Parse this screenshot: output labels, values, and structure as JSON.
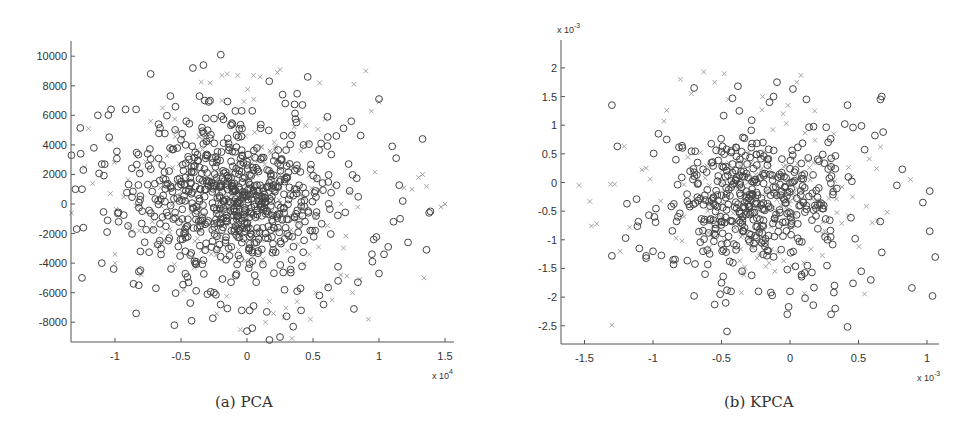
{
  "figure": {
    "captions": {
      "a": "(a) PCA",
      "b": "(b) KPCA"
    }
  },
  "colors": {
    "axis": "#555555",
    "circle": "#454545",
    "cross": "#9a9a9a",
    "text": "#333333"
  },
  "chart_data": [
    {
      "id": "pca",
      "type": "scatter",
      "title": "(a) PCA",
      "xlabel": "",
      "ylabel": "",
      "x_multiplier": "x 10^4",
      "x_multiplier_base": "x 10",
      "x_multiplier_exp": "4",
      "y_multiplier": "",
      "xlim": [
        -1.3,
        1.55
      ],
      "ylim": [
        -9400,
        11000
      ],
      "xticks": [
        -1,
        -0.5,
        0,
        0.5,
        1,
        1.5
      ],
      "xtick_labels": [
        "-1",
        "-0.5",
        "0",
        "0.5",
        "1",
        "1.5"
      ],
      "yticks": [
        -8000,
        -6000,
        -4000,
        -2000,
        0,
        2000,
        4000,
        6000,
        8000,
        10000
      ],
      "ytick_labels": [
        "-8000",
        "-6000",
        "-4000",
        "-2000",
        "0",
        "2000",
        "4000",
        "6000",
        "8000",
        "10000"
      ],
      "grid": false,
      "box": "left-bottom only",
      "legend": null,
      "pixel_frame": {
        "x0": 71,
        "y_top": 41,
        "y_axis": 342,
        "x_end": 454,
        "x_zero": 247,
        "px_per_x": 132,
        "y_zero": 204,
        "px_per_y": 0.01478
      },
      "cloud": {
        "center": [
          -0.1,
          500
        ],
        "spread": [
          0.38,
          2600
        ],
        "n_circle": 700,
        "n_cross": 230,
        "seed": 17
      },
      "series": [
        {
          "name": "class-circle",
          "marker": "o",
          "points": [
            [
              -0.41,
              9200
            ],
            [
              -0.33,
              9400
            ],
            [
              -0.73,
              8800
            ],
            [
              0.46,
              8600
            ],
            [
              -0.58,
              7300
            ],
            [
              -0.36,
              7300
            ],
            [
              1.0,
              7100
            ],
            [
              -0.28,
              7000
            ],
            [
              -0.32,
              7000
            ],
            [
              0.27,
              7400
            ],
            [
              0.29,
              6800
            ],
            [
              0.42,
              6700
            ],
            [
              -1.03,
              6400
            ],
            [
              -0.92,
              6400
            ],
            [
              -0.84,
              6400
            ],
            [
              -1.13,
              6000
            ],
            [
              -0.04,
              6300
            ],
            [
              0.04,
              6300
            ],
            [
              0.61,
              5900
            ],
            [
              0.79,
              5600
            ],
            [
              -0.67,
              5400
            ],
            [
              -0.11,
              5400
            ],
            [
              -0.46,
              5600
            ],
            [
              1.33,
              4400
            ],
            [
              -1.26,
              3400
            ],
            [
              -1.16,
              3800
            ],
            [
              -1.33,
              3300
            ],
            [
              -1.1,
              2700
            ],
            [
              1.1,
              3900
            ],
            [
              1.13,
              3100
            ],
            [
              -1.24,
              2300
            ],
            [
              -1.3,
              1000
            ],
            [
              -1.25,
              1000
            ],
            [
              -1.29,
              -1700
            ],
            [
              -1.24,
              -1600
            ],
            [
              -1.06,
              -1900
            ],
            [
              -1.1,
              -4000
            ],
            [
              -1.01,
              -4400
            ],
            [
              -1.25,
              -5000
            ],
            [
              -0.86,
              -5400
            ],
            [
              -0.82,
              -5500
            ],
            [
              -0.84,
              -7400
            ],
            [
              -0.69,
              -5700
            ],
            [
              -0.55,
              -8200
            ],
            [
              -0.42,
              -7900
            ],
            [
              -0.43,
              -6700
            ],
            [
              -0.3,
              -6100
            ],
            [
              -0.25,
              -6000
            ],
            [
              -0.2,
              -6800
            ],
            [
              -0.04,
              -7200
            ],
            [
              0.02,
              -7200
            ],
            [
              0.05,
              -6900
            ],
            [
              0.0,
              -8600
            ],
            [
              0.04,
              -8400
            ],
            [
              0.15,
              -7300
            ],
            [
              0.17,
              -9200
            ],
            [
              0.25,
              -9000
            ],
            [
              0.3,
              -7600
            ],
            [
              0.35,
              -8300
            ],
            [
              0.38,
              -5900
            ],
            [
              0.41,
              -7200
            ],
            [
              0.58,
              -6800
            ],
            [
              0.81,
              -7100
            ],
            [
              0.69,
              -5200
            ],
            [
              0.84,
              -5300
            ],
            [
              1.0,
              -4700
            ],
            [
              0.95,
              -3900
            ],
            [
              1.07,
              -2900
            ],
            [
              1.22,
              -2600
            ],
            [
              1.36,
              -3100
            ],
            [
              1.39,
              -500
            ],
            [
              1.38,
              -600
            ],
            [
              1.18,
              200
            ],
            [
              1.16,
              -1000
            ],
            [
              1.11,
              -1200
            ],
            [
              0.96,
              -2400
            ]
          ]
        },
        {
          "name": "class-cross",
          "marker": "x",
          "points": [
            [
              -0.19,
              8700
            ],
            [
              -0.15,
              8800
            ],
            [
              -0.07,
              8700
            ],
            [
              0.05,
              8700
            ],
            [
              0.1,
              8600
            ],
            [
              0.23,
              8900
            ],
            [
              0.25,
              9100
            ],
            [
              0.55,
              8200
            ],
            [
              0.9,
              9000
            ],
            [
              1.0,
              6900
            ],
            [
              -0.28,
              8200
            ],
            [
              -0.19,
              7000
            ],
            [
              -1.2,
              5100
            ],
            [
              -1.03,
              4300
            ],
            [
              -0.73,
              5600
            ],
            [
              -0.64,
              6500
            ],
            [
              -1.23,
              2500
            ],
            [
              -1.17,
              1400
            ],
            [
              -1.33,
              -600
            ],
            [
              -1.0,
              -3400
            ],
            [
              -0.8,
              -4800
            ],
            [
              -0.48,
              -5800
            ],
            [
              -0.4,
              -4300
            ],
            [
              0.34,
              -9100
            ],
            [
              0.14,
              -8000
            ],
            [
              0.2,
              -7400
            ],
            [
              -0.05,
              -8500
            ],
            [
              0.38,
              -6600
            ],
            [
              0.48,
              -7800
            ],
            [
              0.52,
              -6000
            ],
            [
              0.61,
              -5500
            ],
            [
              0.71,
              -4800
            ],
            [
              0.8,
              -6000
            ],
            [
              0.92,
              -7800
            ],
            [
              1.34,
              -5000
            ],
            [
              1.19,
              1100
            ],
            [
              1.25,
              1000
            ],
            [
              1.3,
              1800
            ],
            [
              1.33,
              2000
            ],
            [
              1.36,
              1200
            ],
            [
              1.5,
              0
            ],
            [
              1.47,
              -200
            ],
            [
              0.81,
              8100
            ]
          ]
        }
      ]
    },
    {
      "id": "kpca",
      "type": "scatter",
      "title": "(b) KPCA",
      "xlabel": "",
      "ylabel": "",
      "x_multiplier": "x 10^-3",
      "x_multiplier_base": "x 10",
      "x_multiplier_exp": "-3",
      "y_multiplier": "x 10^-3",
      "y_multiplier_base": "x 10",
      "y_multiplier_exp": "-3",
      "xlim": [
        -1.62,
        1.1
      ],
      "ylim": [
        -2.8,
        2.45
      ],
      "xticks": [
        -1.5,
        -1,
        -0.5,
        0,
        0.5,
        1
      ],
      "xtick_labels": [
        "-1.5",
        "-1",
        "-0.5",
        "0",
        "0.5",
        "1"
      ],
      "yticks": [
        -2.5,
        -2,
        -1.5,
        -1,
        -0.5,
        0,
        0.5,
        1,
        1.5,
        2
      ],
      "ytick_labels": [
        "-2.5",
        "-2",
        "-1.5",
        "-1",
        "-0.5",
        "0",
        "0.5",
        "1",
        "1.5",
        "2"
      ],
      "grid": false,
      "box": "left-bottom only",
      "legend": null,
      "pixel_frame": {
        "x0": 561,
        "y_top": 40,
        "y_axis": 344,
        "x_end": 939,
        "x_zero": 790,
        "px_per_x": 137,
        "y_zero": 182.5,
        "px_per_y": 57.3
      },
      "cloud": {
        "center": [
          -0.25,
          -0.3
        ],
        "spread": [
          0.32,
          0.6
        ],
        "n_circle": 430,
        "n_cross": 170,
        "seed": 29
      },
      "series": [
        {
          "name": "class-circle",
          "marker": "o",
          "points": [
            [
              -1.3,
              1.35
            ],
            [
              -1.26,
              0.63
            ],
            [
              -0.96,
              0.85
            ],
            [
              -0.9,
              0.75
            ],
            [
              -0.7,
              1.65
            ],
            [
              -0.38,
              1.68
            ],
            [
              -0.42,
              1.47
            ],
            [
              -0.37,
              1.25
            ],
            [
              0.12,
              1.45
            ],
            [
              -0.15,
              1.4
            ],
            [
              -0.12,
              1.5
            ],
            [
              0.42,
              1.35
            ],
            [
              0.66,
              1.45
            ],
            [
              0.67,
              1.5
            ],
            [
              0.4,
              1.02
            ],
            [
              0.46,
              0.96
            ],
            [
              0.62,
              0.82
            ],
            [
              0.68,
              0.88
            ],
            [
              0.82,
              0.23
            ],
            [
              0.78,
              -0.05
            ],
            [
              1.02,
              -0.15
            ],
            [
              0.97,
              -0.35
            ],
            [
              1.02,
              -0.85
            ],
            [
              1.06,
              -1.3
            ],
            [
              1.04,
              -1.98
            ],
            [
              0.89,
              -1.84
            ],
            [
              0.67,
              -1.22
            ],
            [
              0.59,
              -1.7
            ],
            [
              0.52,
              -1.55
            ],
            [
              0.46,
              -1.76
            ],
            [
              0.42,
              -2.52
            ],
            [
              0.33,
              -2.2
            ],
            [
              0.3,
              -2.3
            ],
            [
              0.32,
              -1.92
            ],
            [
              0.17,
              -2.14
            ],
            [
              0.11,
              -2.02
            ],
            [
              -0.02,
              -2.3
            ],
            [
              -0.01,
              -2.17
            ],
            [
              0.0,
              -1.9
            ],
            [
              -0.13,
              -1.97
            ],
            [
              -0.14,
              -1.92
            ],
            [
              -0.23,
              -1.9
            ],
            [
              -0.43,
              -1.9
            ],
            [
              -0.46,
              -1.88
            ],
            [
              -0.5,
              -1.75
            ],
            [
              -0.46,
              -2.6
            ],
            [
              -0.55,
              -2.13
            ],
            [
              -0.51,
              -1.95
            ],
            [
              -0.7,
              -1.98
            ],
            [
              -0.62,
              -1.6
            ],
            [
              -0.85,
              -1.43
            ],
            [
              -1.05,
              -1.32
            ],
            [
              -1.05,
              -1.28
            ],
            [
              -1.3,
              -1.28
            ],
            [
              -1.2,
              -0.97
            ],
            [
              -1.1,
              -1.15
            ],
            [
              -1.0,
              -1.2
            ],
            [
              -1.19,
              -0.37
            ],
            [
              -1.12,
              -0.29
            ],
            [
              -1.03,
              -0.57
            ],
            [
              -0.99,
              -0.6
            ],
            [
              -0.02,
              -1.52
            ],
            [
              0.16,
              -1.57
            ],
            [
              0.27,
              -1.45
            ],
            [
              -0.6,
              -1.43
            ],
            [
              -0.28,
              -1.62
            ]
          ]
        },
        {
          "name": "class-cross",
          "marker": "x",
          "points": [
            [
              -1.54,
              -0.05
            ],
            [
              -1.46,
              -0.33
            ],
            [
              -1.45,
              -0.76
            ],
            [
              -1.41,
              -0.72
            ],
            [
              -1.31,
              -0.03
            ],
            [
              -1.28,
              -0.03
            ],
            [
              -1.3,
              -2.49
            ],
            [
              -1.24,
              -1.2
            ],
            [
              -1.17,
              -0.78
            ],
            [
              -1.21,
              0.63
            ],
            [
              -1.05,
              0.25
            ],
            [
              -1.08,
              0.22
            ],
            [
              -1.02,
              0.06
            ],
            [
              -0.92,
              1.07
            ],
            [
              -0.9,
              1.26
            ],
            [
              -0.8,
              1.8
            ],
            [
              -0.72,
              1.55
            ],
            [
              -0.63,
              1.93
            ],
            [
              -0.55,
              1.75
            ],
            [
              -0.48,
              1.9
            ],
            [
              -0.45,
              1.45
            ],
            [
              -0.2,
              1.5
            ],
            [
              -0.05,
              1.2
            ],
            [
              0.05,
              1.75
            ],
            [
              0.08,
              1.87
            ],
            [
              0.18,
              1.25
            ],
            [
              0.32,
              0.85
            ],
            [
              0.66,
              0.62
            ],
            [
              0.71,
              -0.52
            ],
            [
              0.6,
              -0.7
            ],
            [
              0.24,
              -0.9
            ],
            [
              0.1,
              -1.4
            ],
            [
              0.88,
              0.05
            ]
          ]
        }
      ]
    }
  ]
}
